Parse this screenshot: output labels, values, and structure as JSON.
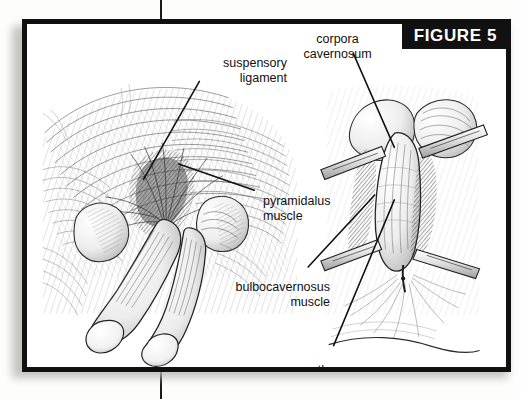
{
  "figure": {
    "badge_label": "FIGURE 5",
    "background_color": "#ffffff",
    "frame_color": "#111111",
    "badge_background": "#111111",
    "badge_text_color": "#ffffff",
    "ink_color": "#1a1a1a"
  },
  "labels": {
    "suspensory_ligament": "suspensory\nligament",
    "corpora_cavernosum": "corpora\ncavernosum",
    "pyramidalus_muscle": "pyramidalus\nmuscle",
    "bulbocavernosus_muscle": "bulbocavernosus\nmuscle",
    "urethra": "urethra"
  },
  "illustrations": {
    "left_panel": "external anatomical view of penis and scrotum with suprapubic hatching",
    "right_panel": "surgical dissection view with four retractors exposing corpora cavernosum and urethra"
  }
}
